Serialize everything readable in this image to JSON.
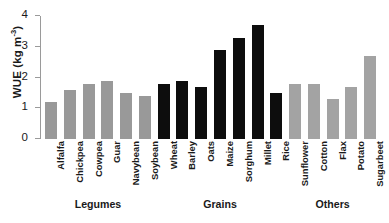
{
  "chart_data": {
    "type": "bar",
    "title": "",
    "xlabel": "",
    "ylabel": "WUE (kg m",
    "ylabel_sup": "-3",
    "ylabel_tail": ")",
    "ylim": [
      0,
      4
    ],
    "ytick_labels": [
      "0",
      "1",
      "2",
      "3",
      "4"
    ],
    "ytick_values": [
      0,
      1,
      2,
      3,
      4
    ],
    "grid": false,
    "legend": "none",
    "categories": [
      "Alfalfa",
      "Chickpea",
      "Cowpea",
      "Guar",
      "Navybean",
      "Soybean",
      "Wheat",
      "Barley",
      "Oats",
      "Maize",
      "Sorghum",
      "Millet",
      "Rice",
      "Sunflower",
      "Cotton",
      "Flax",
      "Potato",
      "Sugarbeet"
    ],
    "values": [
      1.2,
      1.6,
      1.8,
      1.9,
      1.5,
      1.4,
      1.8,
      1.9,
      1.7,
      2.9,
      3.3,
      3.7,
      1.5,
      1.8,
      1.8,
      1.3,
      1.7,
      2.7
    ],
    "bar_groups": [
      "legume",
      "legume",
      "legume",
      "legume",
      "legume",
      "legume",
      "grain",
      "grain",
      "grain",
      "grain",
      "grain",
      "grain",
      "grain",
      "other",
      "other",
      "other",
      "other",
      "other"
    ],
    "groups": [
      {
        "label": "Legumes",
        "color": "#999999",
        "start": 0,
        "end": 5
      },
      {
        "label": "Grains",
        "color": "#0d0d0d",
        "start": 6,
        "end": 12
      },
      {
        "label": "Others",
        "color": "#a3a3a3",
        "start": 13,
        "end": 17
      }
    ],
    "colors": {
      "legume": "#999999",
      "grain": "#0d0d0d",
      "other": "#a3a3a3",
      "axis": "#9a9a9a",
      "text": "#1a1a1a",
      "background": "#ffffff"
    }
  }
}
